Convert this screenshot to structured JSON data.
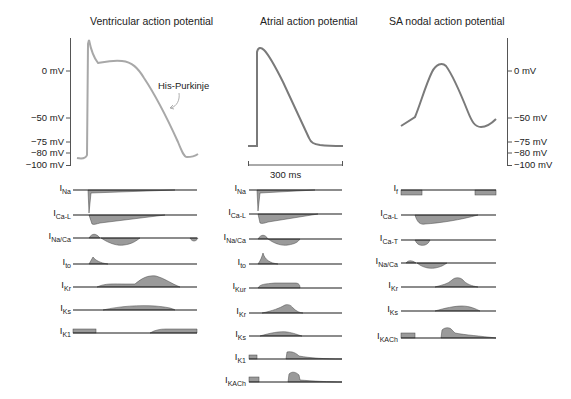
{
  "panels": {
    "ventricular": {
      "title": "Ventricular action potential",
      "annotation": "His-Purkinje",
      "y_ticks": [
        "0 mV",
        "−50 mV",
        "−75 mV",
        "−80 mV",
        "−100 mV"
      ],
      "currents": [
        {
          "name": "I",
          "sub": "Na"
        },
        {
          "name": "I",
          "sub": "Ca-L"
        },
        {
          "name": "I",
          "sub": "Na/Ca"
        },
        {
          "name": "I",
          "sub": "to"
        },
        {
          "name": "I",
          "sub": "Kr"
        },
        {
          "name": "I",
          "sub": "Ks"
        },
        {
          "name": "I",
          "sub": "K1"
        }
      ]
    },
    "atrial": {
      "title": "Atrial action potential",
      "scale_bar": "300 ms",
      "currents": [
        {
          "name": "I",
          "sub": "Na"
        },
        {
          "name": "I",
          "sub": "Ca-L"
        },
        {
          "name": "I",
          "sub": "Na/Ca"
        },
        {
          "name": "I",
          "sub": "to"
        },
        {
          "name": "I",
          "sub": "Kur"
        },
        {
          "name": "I",
          "sub": "Kr"
        },
        {
          "name": "I",
          "sub": "Ks"
        },
        {
          "name": "I",
          "sub": "K1"
        },
        {
          "name": "I",
          "sub": "KACh"
        }
      ]
    },
    "sa_nodal": {
      "title": "SA nodal action potential",
      "y_ticks": [
        "0 mV",
        "−50 mV",
        "−75 mV",
        "−80 mV",
        "−100 mV"
      ],
      "currents": [
        {
          "name": "I",
          "sub": "f"
        },
        {
          "name": "I",
          "sub": "Ca-L"
        },
        {
          "name": "I",
          "sub": "Ca-T"
        },
        {
          "name": "I",
          "sub": "Na/Ca"
        },
        {
          "name": "I",
          "sub": "Kr"
        },
        {
          "name": "I",
          "sub": "Ks"
        },
        {
          "name": "I",
          "sub": "KACh"
        }
      ]
    }
  },
  "colors": {
    "ventricular_trace": "#a8a8a8",
    "atrial_trace": "#7a7a7a",
    "sa_trace": "#7a7a7a",
    "current_fill": "#9a9a9a",
    "baseline": "#1a1a1a",
    "axis": "#555555"
  }
}
